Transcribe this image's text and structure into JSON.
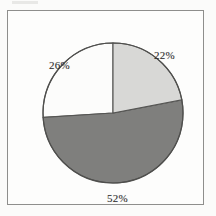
{
  "figure": {
    "background_color": "#fdfdfc",
    "frame_color": "#8e8e8c"
  },
  "chart_data": {
    "type": "pie",
    "title": "",
    "subtitle": "",
    "xlabel": "",
    "ylabel": "",
    "legend": null,
    "grid": false,
    "start_angle_deg": 0,
    "direction": "clockwise",
    "center": {
      "x": 112,
      "y": 112
    },
    "radius": 70,
    "categories": [
      "22%",
      "52%",
      "26%"
    ],
    "values": [
      22,
      52,
      26
    ],
    "labels": [
      "22%",
      "52%",
      "26%"
    ],
    "total": 100,
    "units": "percent",
    "slices": [
      {
        "label": "22%",
        "value": 22,
        "color": "#d8d8d6",
        "edge_color": "#555553",
        "start_angle_deg": 0,
        "end_angle_deg": 79.2,
        "label_position": "upper-right"
      },
      {
        "label": "52%",
        "value": 52,
        "color": "#7f7f7d",
        "edge_color": "#555553",
        "start_angle_deg": 79.2,
        "end_angle_deg": 266.4,
        "label_position": "bottom"
      },
      {
        "label": "26%",
        "value": 26,
        "color": "#fcfcfb",
        "edge_color": "#555553",
        "start_angle_deg": 266.4,
        "end_angle_deg": 360,
        "label_position": "upper-left"
      }
    ]
  }
}
